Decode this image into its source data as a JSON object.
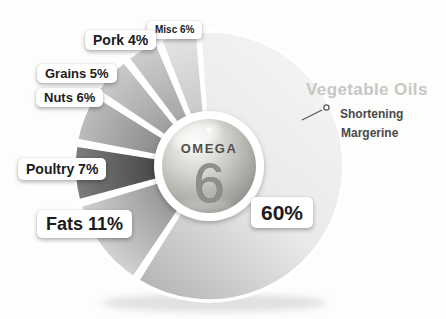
{
  "chart_data": {
    "type": "pie",
    "title": "OMEGA 6",
    "center_label": {
      "word": "OMEGA",
      "number": "6"
    },
    "geometry": {
      "cx": 209,
      "cy": 166,
      "r": 135,
      "ring_r": 55,
      "ball_r": 47
    },
    "slices": [
      {
        "label": "Vegetable Oils",
        "value": 60,
        "callout": "60%",
        "start": -4,
        "end": 212,
        "gradient": "linear",
        "colors": [
          "#f5f5f4",
          "#e9e9e8",
          "#ababab"
        ]
      },
      {
        "label": "Fats",
        "value": 11,
        "callout": "Fats 11%",
        "start": 214,
        "end": 253,
        "gradient": "radial",
        "colors": [
          "#969696",
          "#d2d2d2"
        ]
      },
      {
        "label": "Poultry",
        "value": 7,
        "callout": "Poultry 7%",
        "start": 255,
        "end": 279,
        "gradient": "radial",
        "colors": [
          "#474747",
          "#7d7d7d"
        ]
      },
      {
        "label": "Nuts",
        "value": 6,
        "callout": "Nuts 6%",
        "start": 281,
        "end": 302,
        "gradient": "radial",
        "colors": [
          "#8a8a8a",
          "#bdbdbd"
        ]
      },
      {
        "label": "Grains",
        "value": 5,
        "callout": "Grains 5%",
        "start": 304,
        "end": 321,
        "gradient": "radial",
        "colors": [
          "#9d9d9d",
          "#cbcbcb"
        ]
      },
      {
        "label": "Pork",
        "value": 4,
        "callout": "Pork 4%",
        "start": 323,
        "end": 337,
        "gradient": "radial",
        "colors": [
          "#a5a5a5",
          "#cecece"
        ]
      },
      {
        "label": "Misc",
        "value": 6,
        "callout": "Misc 6%",
        "start": 339,
        "end": 355,
        "gradient": "radial",
        "colors": [
          "#c8c8c8",
          "#e4e4e4"
        ]
      }
    ],
    "annotation": {
      "title": "Vegetable Oils",
      "lines": [
        "Shortening",
        "Margerine"
      ]
    },
    "style": {
      "background": "#fdfdfc",
      "callout_text_color": "#1c1c1c",
      "annotation_title_color": "#c7c7c5",
      "annotation_text_color": "#4a4a4a",
      "gap_color": "#ffffff"
    },
    "legend": "none",
    "grid": "off"
  }
}
